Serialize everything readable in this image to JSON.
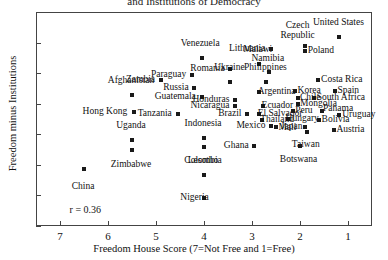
{
  "chart_data": {
    "type": "scatter",
    "title": "and Institutions of Democracy",
    "xlabel": "Freedom House Score (7=Not Free and 1=Free)",
    "ylabel": "Freedom minus Institutions",
    "xlim": [
      7.5,
      0.5
    ],
    "ylim": [
      -0.6,
      0.8
    ],
    "x_reversed": true,
    "xticks": [
      7,
      6,
      5,
      4,
      3,
      2,
      1
    ],
    "yticks": [
      -0.6,
      -0.4,
      -0.2,
      0,
      0.2,
      0.4,
      0.6,
      0.8
    ],
    "ytick_labels": [
      "-0.6",
      "-0.4",
      "-0.2",
      "0",
      "0.2",
      "0.4",
      "0.6",
      "0.8"
    ],
    "grid": false,
    "legend": null,
    "annotations": [
      {
        "text": "r = 0.36",
        "x": 6.8,
        "y": -0.49
      }
    ],
    "correlation": 0.36,
    "points": [
      {
        "name": "China",
        "x": 6.5,
        "y": -0.23,
        "lx": 6.52,
        "ly": -0.31,
        "pos": "ct"
      },
      {
        "name": "Afghanistan",
        "x": 5.5,
        "y": 0.26,
        "lx": 5.52,
        "ly": 0.325,
        "pos": "cb"
      },
      {
        "name": "Hong Kong",
        "x": 5.45,
        "y": 0.145,
        "lx": 5.6,
        "ly": 0.145,
        "pos": "r"
      },
      {
        "name": "Uganda",
        "x": 5.5,
        "y": -0.035,
        "lx": 5.52,
        "ly": 0.028,
        "pos": "cb"
      },
      {
        "name": "Zimbabwe",
        "x": 5.5,
        "y": -0.105,
        "lx": 5.52,
        "ly": -0.165,
        "pos": "ct"
      },
      {
        "name": "Zambia",
        "x": 4.9,
        "y": 0.355,
        "lx": 5.02,
        "ly": 0.355,
        "pos": "r"
      },
      {
        "name": "Tanzania",
        "x": 4.55,
        "y": 0.135,
        "lx": 4.67,
        "ly": 0.135,
        "pos": "r"
      },
      {
        "name": "Venezuela",
        "x": 4.05,
        "y": 0.5,
        "lx": 4.08,
        "ly": 0.565,
        "pos": "cb"
      },
      {
        "name": "Paraguay",
        "x": 4.25,
        "y": 0.385,
        "lx": 4.37,
        "ly": 0.385,
        "pos": "r"
      },
      {
        "name": "Russia",
        "x": 4.2,
        "y": 0.3,
        "lx": 4.32,
        "ly": 0.3,
        "pos": "r"
      },
      {
        "name": "Guatemala",
        "x": 4.05,
        "y": 0.245,
        "lx": 4.17,
        "ly": 0.245,
        "pos": "r"
      },
      {
        "name": "Indonesia",
        "x": 4.0,
        "y": -0.025,
        "lx": 4.02,
        "ly": 0.038,
        "pos": "cb"
      },
      {
        "name": "Lesotho",
        "x": 4.0,
        "y": -0.085,
        "lx": 4.02,
        "ly": -0.145,
        "pos": "ct"
      },
      {
        "name": "Colombia",
        "x": 4.0,
        "y": -0.265,
        "lx": 4.02,
        "ly": -0.2,
        "pos": "cb"
      },
      {
        "name": "Nigeria",
        "x": 4.0,
        "y": -0.415,
        "lx": 3.9,
        "ly": -0.415,
        "pos": "r"
      },
      {
        "name": "Romania",
        "x": 3.45,
        "y": 0.425,
        "lx": 3.57,
        "ly": 0.425,
        "pos": "r"
      },
      {
        "name": "Ukraine",
        "x": 3.45,
        "y": 0.345,
        "lx": 3.47,
        "ly": 0.405,
        "pos": "cb"
      },
      {
        "name": "Honduras",
        "x": 3.35,
        "y": 0.225,
        "lx": 3.47,
        "ly": 0.225,
        "pos": "r"
      },
      {
        "name": "Nicaragua",
        "x": 3.35,
        "y": 0.185,
        "lx": 3.47,
        "ly": 0.185,
        "pos": "r"
      },
      {
        "name": "Brazil",
        "x": 3.1,
        "y": 0.135,
        "lx": 3.22,
        "ly": 0.135,
        "pos": "r"
      },
      {
        "name": "Ghana",
        "x": 2.95,
        "y": -0.075,
        "lx": 3.07,
        "ly": -0.075,
        "pos": "r"
      },
      {
        "name": "Malawi",
        "x": 2.85,
        "y": 0.46,
        "lx": 2.88,
        "ly": 0.525,
        "pos": "cb"
      },
      {
        "name": "Lithuania",
        "x": 2.6,
        "y": 0.555,
        "lx": 2.72,
        "ly": 0.555,
        "pos": "r"
      },
      {
        "name": "Namibia",
        "x": 2.65,
        "y": 0.405,
        "lx": 2.67,
        "ly": 0.468,
        "pos": "cb"
      },
      {
        "name": "Philippines",
        "x": 2.7,
        "y": 0.345,
        "lx": 2.72,
        "ly": 0.408,
        "pos": "cb"
      },
      {
        "name": "Argentina",
        "x": 2.85,
        "y": 0.275,
        "lx": 2.88,
        "ly": 0.275,
        "pos": "l"
      },
      {
        "name": "Ecuador",
        "x": 2.78,
        "y": 0.185,
        "lx": 2.8,
        "ly": 0.185,
        "pos": "l"
      },
      {
        "name": "El Salvador",
        "x": 2.85,
        "y": 0.135,
        "lx": 2.88,
        "ly": 0.135,
        "pos": "l"
      },
      {
        "name": "Thailand",
        "x": 2.8,
        "y": 0.095,
        "lx": 2.83,
        "ly": 0.095,
        "pos": "l"
      },
      {
        "name": "Mexico",
        "x": 2.6,
        "y": 0.055,
        "lx": 2.72,
        "ly": 0.055,
        "pos": "r"
      },
      {
        "name": "Mali",
        "x": 2.5,
        "y": 0.045,
        "lx": 2.45,
        "ly": 0.038,
        "pos": "l"
      },
      {
        "name": "Hungary",
        "x": 2.25,
        "y": 0.1,
        "lx": 2.3,
        "ly": 0.1,
        "pos": "l"
      },
      {
        "name": "Peru",
        "x": 2.15,
        "y": 0.155,
        "lx": 2.1,
        "ly": 0.155,
        "pos": "l"
      },
      {
        "name": "Korea",
        "x": 2.1,
        "y": 0.285,
        "lx": 2.05,
        "ly": 0.285,
        "pos": "l"
      },
      {
        "name": "Chile",
        "x": 2.05,
        "y": 0.235,
        "lx": 2.0,
        "ly": 0.235,
        "pos": "l"
      },
      {
        "name": "Mongolia",
        "x": 2.05,
        "y": 0.195,
        "lx": 2.0,
        "ly": 0.195,
        "pos": "l"
      },
      {
        "name": "Japan",
        "x": 1.9,
        "y": 0.045,
        "lx": 1.95,
        "ly": 0.045,
        "pos": "r"
      },
      {
        "name": "Taiwan",
        "x": 1.85,
        "y": 0.015,
        "lx": 1.88,
        "ly": -0.04,
        "pos": "ct"
      },
      {
        "name": "Botswana",
        "x": 2.0,
        "y": -0.075,
        "lx": 2.03,
        "ly": -0.135,
        "pos": "ct"
      },
      {
        "name": "Bolivia",
        "x": 1.6,
        "y": 0.095,
        "lx": 1.55,
        "ly": 0.095,
        "pos": "l"
      },
      {
        "name": "Panama",
        "x": 1.55,
        "y": 0.155,
        "lx": 1.52,
        "ly": 0.165,
        "pos": "l"
      },
      {
        "name": "South Africa",
        "x": 1.7,
        "y": 0.235,
        "lx": 1.65,
        "ly": 0.235,
        "pos": "l"
      },
      {
        "name": "Costa Rica",
        "x": 1.62,
        "y": 0.355,
        "lx": 1.56,
        "ly": 0.355,
        "pos": "l"
      },
      {
        "name": "Spain",
        "x": 1.28,
        "y": 0.285,
        "lx": 1.22,
        "ly": 0.285,
        "pos": "l"
      },
      {
        "name": "Uruguay",
        "x": 1.18,
        "y": 0.125,
        "lx": 1.12,
        "ly": 0.125,
        "pos": "l"
      },
      {
        "name": "Austria",
        "x": 1.3,
        "y": 0.025,
        "lx": 1.24,
        "ly": 0.025,
        "pos": "l"
      },
      {
        "name": "Poland",
        "x": 1.9,
        "y": 0.545,
        "lx": 1.84,
        "ly": 0.545,
        "pos": "l"
      },
      {
        "name": "Czech Republic",
        "x": 1.9,
        "y": 0.575,
        "lx": 2.05,
        "ly": 0.685,
        "pos": "c"
      },
      {
        "name": "United States",
        "x": 1.18,
        "y": 0.635,
        "lx": 1.2,
        "ly": 0.7,
        "pos": "cb"
      }
    ]
  }
}
